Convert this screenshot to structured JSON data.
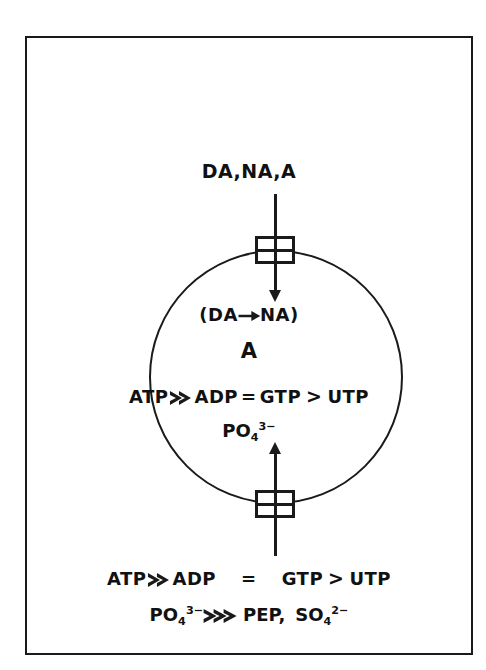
{
  "figure": {
    "page_artifacts": {
      "bleed_left": "",
      "bleed_right": ""
    },
    "influx": {
      "substrates_label": "DA,NA,A",
      "channel_icon": "membrane-transport-channel",
      "arrow_icon": "down-arrow"
    },
    "cell_interior": {
      "conversion_open_paren": "(",
      "conversion_from": "DA",
      "conversion_arrow_icon": "right-arrow",
      "conversion_to": "NA",
      "conversion_close_paren": ")",
      "accumulated_species": "A",
      "nucleotide_series": {
        "item_1": "ATP",
        "op_1": "much-greater-than",
        "item_2": "ADP",
        "op_2": "equals",
        "item_3": "GTP",
        "op_3": "greater-than",
        "item_4": "UTP"
      },
      "phosphate": {
        "formula": "PO",
        "subscript": "4",
        "superscript": "3−"
      }
    },
    "efflux": {
      "channel_icon": "membrane-transport-channel",
      "arrow_icon": "up-arrow"
    },
    "legend": {
      "line_1": {
        "item_1": "ATP",
        "op_1": "much-greater-than",
        "item_2": "ADP",
        "op_2": "=",
        "item_3": "GTP",
        "op_3": "greater-than",
        "item_4": "UTP"
      },
      "line_2": {
        "phosphate_formula": "PO",
        "phosphate_subscript": "4",
        "phosphate_superscript": "3−",
        "op": "very-much-greater-than",
        "item_pep": "PEP,",
        "sulfate_formula": "SO",
        "sulfate_subscript": "4",
        "sulfate_superscript": "2−"
      }
    },
    "colors": {
      "ink": "#1a1a1a",
      "paper": "#ffffff",
      "bleed": "#d9d9d9"
    }
  }
}
